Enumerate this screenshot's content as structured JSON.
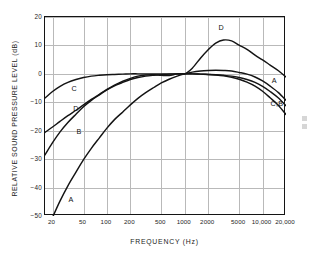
{
  "figure": {
    "caption_present": false,
    "style": "scanned-line-chart"
  },
  "chart_data": {
    "type": "line",
    "title": "",
    "xlabel": "FREQUENCY  (Hz)",
    "ylabel": "RELATIVE SOUND PRESSURE LEVEL (dB)",
    "xscale": "log",
    "xlim": [
      16,
      20000
    ],
    "ylim": [
      -50,
      20
    ],
    "yticks": [
      20,
      10,
      0,
      -10,
      -20,
      -30,
      -40,
      -50
    ],
    "ytick_labels": [
      "20",
      "10",
      "0",
      "−10",
      "−20",
      "−30",
      "−40",
      "−50"
    ],
    "xticks": [
      20,
      50,
      100,
      200,
      500,
      1000,
      2000,
      5000,
      10000,
      20000
    ],
    "xtick_labels": [
      "20",
      "50",
      "100",
      "200",
      "500",
      "1000",
      "2000",
      "5000",
      "10,000",
      "20,000"
    ],
    "grid": true,
    "grid_color": "#b9b9b9",
    "line_color": "#141414",
    "legend": "inline-curve-labels",
    "series": [
      {
        "name": "A",
        "label_left": "A",
        "label_right": "A",
        "x": [
          16,
          20,
          25,
          31.5,
          40,
          50,
          63,
          80,
          100,
          125,
          160,
          200,
          250,
          315,
          400,
          500,
          630,
          800,
          1000,
          1250,
          1600,
          2000,
          2500,
          3150,
          4000,
          5000,
          6300,
          8000,
          10000,
          12500,
          16000,
          20000
        ],
        "values": [
          -56.7,
          -50.5,
          -44.7,
          -39.4,
          -34.6,
          -30.2,
          -26.2,
          -22.5,
          -19.1,
          -16.1,
          -13.4,
          -10.9,
          -8.6,
          -6.6,
          -4.8,
          -3.2,
          -1.9,
          -0.8,
          0.0,
          0.6,
          1.0,
          1.2,
          1.3,
          1.2,
          1.0,
          0.5,
          -0.1,
          -1.1,
          -2.5,
          -4.3,
          -6.6,
          -9.3
        ]
      },
      {
        "name": "B",
        "label_left": "B",
        "label_right": "C,B",
        "x": [
          16,
          20,
          25,
          31.5,
          40,
          50,
          63,
          80,
          100,
          125,
          160,
          200,
          250,
          315,
          400,
          500,
          630,
          800,
          1000,
          1250,
          1600,
          2000,
          2500,
          3150,
          4000,
          5000,
          6300,
          8000,
          10000,
          12500,
          16000,
          20000
        ],
        "values": [
          -28.5,
          -24.2,
          -20.4,
          -17.1,
          -14.2,
          -11.6,
          -9.3,
          -7.4,
          -5.6,
          -4.2,
          -3.0,
          -2.0,
          -1.3,
          -0.8,
          -0.5,
          -0.3,
          -0.1,
          0.0,
          0.0,
          0.0,
          -0.1,
          -0.2,
          -0.4,
          -0.7,
          -1.2,
          -1.9,
          -2.9,
          -4.3,
          -6.1,
          -8.4,
          -11.1,
          -14.3
        ]
      },
      {
        "name": "C",
        "label_left": "C",
        "label_right": "C,B",
        "x": [
          16,
          20,
          25,
          31.5,
          40,
          50,
          63,
          80,
          100,
          125,
          160,
          200,
          250,
          315,
          400,
          500,
          630,
          800,
          1000,
          1250,
          1600,
          2000,
          2500,
          3150,
          4000,
          5000,
          6300,
          8000,
          10000,
          12500,
          16000,
          20000
        ],
        "values": [
          -8.5,
          -6.2,
          -4.4,
          -3.0,
          -2.0,
          -1.3,
          -0.8,
          -0.5,
          -0.3,
          -0.2,
          -0.1,
          0.0,
          0.0,
          0.0,
          0.0,
          0.0,
          0.0,
          0.0,
          0.0,
          0.0,
          -0.1,
          -0.2,
          -0.3,
          -0.5,
          -0.8,
          -1.3,
          -2.0,
          -3.0,
          -4.4,
          -6.2,
          -8.5,
          -11.2
        ]
      },
      {
        "name": "D",
        "label_left": "D",
        "label_right": "D",
        "x": [
          16,
          20,
          25,
          31.5,
          40,
          50,
          63,
          80,
          100,
          125,
          160,
          200,
          250,
          315,
          400,
          500,
          630,
          800,
          1000,
          1250,
          1600,
          2000,
          2500,
          3150,
          4000,
          5000,
          6300,
          8000,
          10000,
          12500,
          16000,
          20000
        ],
        "values": [
          -20.6,
          -18.7,
          -16.7,
          -14.7,
          -12.8,
          -10.9,
          -9.0,
          -7.2,
          -5.5,
          -4.0,
          -2.6,
          -1.6,
          -0.8,
          -0.4,
          -0.3,
          -0.5,
          -0.6,
          -0.0,
          0.0,
          2.0,
          5.6,
          8.5,
          10.8,
          11.9,
          11.6,
          10.1,
          8.6,
          6.6,
          4.9,
          3.1,
          1.1,
          -1.1
        ]
      }
    ],
    "annotations": [
      {
        "text": "C",
        "series": "C",
        "position": "left-of-curve",
        "x": 36,
        "y": -5.5
      },
      {
        "text": "D",
        "series": "D",
        "position": "left-of-curve",
        "x": 38,
        "y": -12.5
      },
      {
        "text": "B",
        "series": "B",
        "position": "left-of-curve",
        "x": 42,
        "y": -20.5
      },
      {
        "text": "A",
        "series": "A",
        "position": "left-of-curve",
        "x": 33,
        "y": -44.5
      },
      {
        "text": "D",
        "series": "D",
        "position": "above-peak",
        "x": 2800,
        "y": 16.0
      },
      {
        "text": "A",
        "series": "A",
        "position": "right-of-curve",
        "x": 13500,
        "y": -2.5
      },
      {
        "text": "C,B",
        "series": "C,B",
        "position": "right-of-curve",
        "x": 13000,
        "y": -10.5
      }
    ]
  }
}
